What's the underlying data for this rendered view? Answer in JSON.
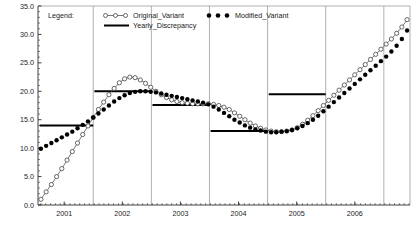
{
  "chart_data": {
    "type": "line",
    "title": "",
    "xlabel": "",
    "ylabel": "",
    "xlim": [
      2000.55,
      2006.95
    ],
    "ylim": [
      0.0,
      35.0
    ],
    "grid": "vertical year separators",
    "y_ticks": [
      "0.0",
      "5.0",
      "10.0",
      "15.0",
      "20.0",
      "25.0",
      "30.0",
      "35.0"
    ],
    "y_tick_values": [
      0,
      5,
      10,
      15,
      20,
      25,
      30,
      35
    ],
    "x_ticks": [
      "2001",
      "2002",
      "2003",
      "2004",
      "2005",
      "2006"
    ],
    "x_tick_values": [
      2001,
      2002,
      2003,
      2004,
      2005,
      2006
    ],
    "series": [
      {
        "name": "Original_Variant",
        "marker": "open-circle",
        "line": "thin-solid",
        "color": "#555555",
        "x": [
          2000.6,
          2000.69,
          2000.78,
          2000.87,
          2000.96,
          2001.05,
          2001.14,
          2001.23,
          2001.32,
          2001.41,
          2001.5,
          2001.59,
          2001.68,
          2001.77,
          2001.86,
          2001.95,
          2002.04,
          2002.13,
          2002.22,
          2002.31,
          2002.4,
          2002.49,
          2002.58,
          2002.67,
          2002.76,
          2002.85,
          2002.94,
          2003.03,
          2003.12,
          2003.21,
          2003.3,
          2003.39,
          2003.48,
          2003.57,
          2003.66,
          2003.75,
          2003.84,
          2003.93,
          2004.02,
          2004.11,
          2004.2,
          2004.29,
          2004.38,
          2004.47,
          2004.56,
          2004.65,
          2004.74,
          2004.83,
          2004.92,
          2005.01,
          2005.1,
          2005.19,
          2005.28,
          2005.37,
          2005.46,
          2005.55,
          2005.64,
          2005.73,
          2005.82,
          2005.91,
          2006.0,
          2006.09,
          2006.18,
          2006.27,
          2006.36,
          2006.45,
          2006.54,
          2006.63,
          2006.72,
          2006.81,
          2006.9
        ],
        "values": [
          1.0,
          2.3,
          3.6,
          5.0,
          6.4,
          7.9,
          9.4,
          10.9,
          12.4,
          13.9,
          15.4,
          16.8,
          18.1,
          19.4,
          20.5,
          21.5,
          22.2,
          22.5,
          22.4,
          22.0,
          21.4,
          20.7,
          20.0,
          19.4,
          18.9,
          18.5,
          18.2,
          18.0,
          17.9,
          17.8,
          17.8,
          17.8,
          17.8,
          17.7,
          17.5,
          17.2,
          16.8,
          16.2,
          15.6,
          15.0,
          14.4,
          13.9,
          13.5,
          13.2,
          13.0,
          12.9,
          12.9,
          13.0,
          13.2,
          13.6,
          14.2,
          14.9,
          15.7,
          16.6,
          17.5,
          18.4,
          19.3,
          20.2,
          21.1,
          22.0,
          22.9,
          23.8,
          24.7,
          25.6,
          26.5,
          27.4,
          28.3,
          29.2,
          30.2,
          31.3,
          32.6
        ]
      },
      {
        "name": "Modified_Variant",
        "marker": "filled-circle",
        "line": "none",
        "color": "#000000",
        "x": [
          2000.6,
          2000.69,
          2000.78,
          2000.87,
          2000.96,
          2001.05,
          2001.14,
          2001.23,
          2001.32,
          2001.41,
          2001.5,
          2001.59,
          2001.68,
          2001.77,
          2001.86,
          2001.95,
          2002.04,
          2002.13,
          2002.22,
          2002.31,
          2002.4,
          2002.49,
          2002.58,
          2002.67,
          2002.76,
          2002.85,
          2002.94,
          2003.03,
          2003.12,
          2003.21,
          2003.3,
          2003.39,
          2003.48,
          2003.57,
          2003.66,
          2003.75,
          2003.84,
          2003.93,
          2004.02,
          2004.11,
          2004.2,
          2004.29,
          2004.38,
          2004.47,
          2004.56,
          2004.65,
          2004.74,
          2004.83,
          2004.92,
          2005.01,
          2005.1,
          2005.19,
          2005.28,
          2005.37,
          2005.46,
          2005.55,
          2005.64,
          2005.73,
          2005.82,
          2005.91,
          2006.0,
          2006.09,
          2006.18,
          2006.27,
          2006.36,
          2006.45,
          2006.54,
          2006.63,
          2006.72,
          2006.81,
          2006.9
        ],
        "values": [
          9.9,
          10.4,
          10.9,
          11.4,
          11.9,
          12.4,
          12.9,
          13.5,
          14.1,
          14.7,
          15.4,
          16.1,
          16.8,
          17.5,
          18.2,
          18.8,
          19.3,
          19.7,
          19.9,
          20.0,
          20.0,
          19.9,
          19.8,
          19.6,
          19.4,
          19.2,
          19.0,
          18.8,
          18.6,
          18.4,
          18.2,
          18.0,
          17.7,
          17.3,
          16.8,
          16.2,
          15.6,
          15.0,
          14.5,
          14.0,
          13.6,
          13.3,
          13.1,
          12.9,
          12.8,
          12.8,
          12.9,
          13.0,
          13.2,
          13.5,
          13.9,
          14.4,
          15.0,
          15.7,
          16.5,
          17.3,
          18.1,
          18.9,
          19.7,
          20.5,
          21.3,
          22.1,
          22.9,
          23.7,
          24.5,
          25.3,
          26.1,
          27.0,
          28.0,
          29.2,
          30.7
        ]
      },
      {
        "name": "Yearly_Discrepancy",
        "marker": "none",
        "line": "thick-step",
        "color": "#000000",
        "segments": [
          {
            "year": "2001",
            "x_start": 2000.58,
            "x_end": 2001.5,
            "value": 14.0
          },
          {
            "year": "2002",
            "x_start": 2001.52,
            "x_end": 2002.5,
            "value": 20.0
          },
          {
            "year": "2003",
            "x_start": 2002.52,
            "x_end": 2003.5,
            "value": 17.6
          },
          {
            "year": "2004",
            "x_start": 2003.52,
            "x_end": 2004.5,
            "value": 13.0
          },
          {
            "year": "2005",
            "x_start": 2004.52,
            "x_end": 2005.5,
            "value": 19.5
          }
        ]
      }
    ]
  },
  "legend": {
    "title": "Legend:",
    "entries": [
      {
        "label": "Original_Variant",
        "style": "open-circle-line"
      },
      {
        "label": "Yearly_Discrepancy",
        "style": "thick-line"
      },
      {
        "label": "Modified_Variant",
        "style": "filled-circle"
      }
    ]
  },
  "colors": {
    "background": "#ffffff",
    "axis": "#2b2b2b",
    "gridline": "#8c8c8c",
    "series_open": "#555555",
    "series_filled": "#000000",
    "step_line": "#000000",
    "text": "#1a1a1a"
  }
}
